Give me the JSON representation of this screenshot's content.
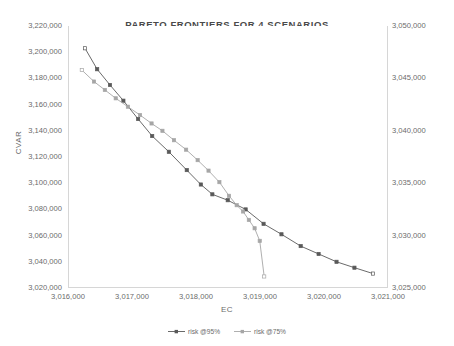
{
  "chart_data": {
    "type": "line",
    "title": "PARETO FRONTIERS FOR 4 SCENARIOS",
    "xlabel": "EC",
    "ylabel": "CVAR",
    "y2label": "",
    "grid": false,
    "legend_position": "bottom",
    "xlim": [
      3016000,
      3021000
    ],
    "ylim": [
      3020000,
      3220000
    ],
    "y2lim": [
      3025000,
      3050000
    ],
    "xticks": [
      "3,016,000",
      "3,017,000",
      "3,018,000",
      "3,019,000",
      "3,020,000",
      "3,021,000"
    ],
    "xtick_values": [
      3016000,
      3017000,
      3018000,
      3019000,
      3020000,
      3021000
    ],
    "yticks": [
      "3,020,000",
      "3,040,000",
      "3,060,000",
      "3,080,000",
      "3,100,000",
      "3,120,000",
      "3,140,000",
      "3,160,000",
      "3,180,000",
      "3,200,000",
      "3,220,000"
    ],
    "ytick_values": [
      3020000,
      3040000,
      3060000,
      3080000,
      3100000,
      3120000,
      3140000,
      3160000,
      3180000,
      3200000,
      3220000
    ],
    "y2ticks": [
      "3,025,000",
      "3,030,000",
      "3,035,000",
      "3,040,000",
      "3,045,000",
      "3,050,000"
    ],
    "y2tick_values": [
      3025000,
      3030000,
      3035000,
      3040000,
      3045000,
      3050000
    ],
    "series": [
      {
        "name": "risk @95%",
        "axis": "left",
        "color": "#595959",
        "marker": "square",
        "points": [
          [
            3016250,
            3203000
          ],
          [
            3016440,
            3187000
          ],
          [
            3016640,
            3175000
          ],
          [
            3016850,
            3163000
          ],
          [
            3017080,
            3149000
          ],
          [
            3017300,
            3136000
          ],
          [
            3017560,
            3124000
          ],
          [
            3017840,
            3110000
          ],
          [
            3018060,
            3099000
          ],
          [
            3018240,
            3091500
          ],
          [
            3018480,
            3087000
          ],
          [
            3018760,
            3080000
          ],
          [
            3019040,
            3069000
          ],
          [
            3019320,
            3061000
          ],
          [
            3019620,
            3052000
          ],
          [
            3019900,
            3046000
          ],
          [
            3020180,
            3040000
          ],
          [
            3020460,
            3035500
          ],
          [
            3020750,
            3031000
          ]
        ]
      },
      {
        "name": "risk @75%",
        "axis": "right",
        "color": "#a6a6a6",
        "marker": "square",
        "points": [
          [
            3016200,
            3045800
          ],
          [
            3016390,
            3044700
          ],
          [
            3016560,
            3043900
          ],
          [
            3016730,
            3043100
          ],
          [
            3016920,
            3042300
          ],
          [
            3017110,
            3041500
          ],
          [
            3017290,
            3040700
          ],
          [
            3017460,
            3040000
          ],
          [
            3017640,
            3039100
          ],
          [
            3017830,
            3038200
          ],
          [
            3018010,
            3037200
          ],
          [
            3018180,
            3036200
          ],
          [
            3018350,
            3035100
          ],
          [
            3018500,
            3033800
          ],
          [
            3018620,
            3032900
          ],
          [
            3018720,
            3032300
          ],
          [
            3018810,
            3031500
          ],
          [
            3018900,
            3030700
          ],
          [
            3018980,
            3029500
          ],
          [
            3019050,
            3026100
          ]
        ]
      }
    ]
  },
  "legend": {
    "items": [
      {
        "label": "risk @95%",
        "color": "#595959"
      },
      {
        "label": "risk @75%",
        "color": "#a6a6a6"
      }
    ]
  }
}
